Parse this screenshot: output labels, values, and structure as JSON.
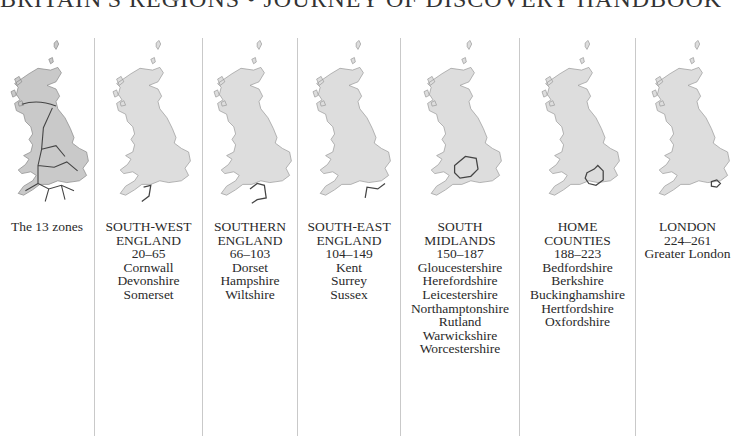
{
  "header": {
    "title": "BRITAIN'S REGIONS • JOURNEY OF DISCOVERY HANDBOOK"
  },
  "panels": [
    {
      "caption_lines": [
        "The 13 zones"
      ],
      "highlight": "all"
    },
    {
      "caption_lines": [
        "SOUTH-WEST",
        "ENGLAND",
        "20–65",
        "Cornwall",
        "Devonshire",
        "Somerset"
      ],
      "highlight": "south-west"
    },
    {
      "caption_lines": [
        "SOUTHERN",
        "ENGLAND",
        "66–103",
        "Dorset",
        "Hampshire",
        "Wiltshire"
      ],
      "highlight": "southern"
    },
    {
      "caption_lines": [
        "SOUTH-EAST",
        "ENGLAND",
        "104–149",
        "Kent",
        "Surrey",
        "Sussex"
      ],
      "highlight": "south-east"
    },
    {
      "caption_lines": [
        "SOUTH",
        "MIDLANDS",
        "150–187",
        "Gloucestershire",
        "Herefordshire",
        "Leicestershire",
        "Northamptonshire",
        "Rutland",
        "Warwickshire",
        "Worcestershire"
      ],
      "highlight": "south-midlands"
    },
    {
      "caption_lines": [
        "HOME",
        "COUNTIES",
        "188–223",
        "Bedfordshire",
        "Berkshire",
        "Buckinghamshire",
        "Hertfordshire",
        "Oxfordshire"
      ],
      "highlight": "home-counties"
    },
    {
      "caption_lines": [
        "LONDON",
        "224–261",
        "Greater London"
      ],
      "highlight": "london"
    }
  ],
  "colors": {
    "map_fill_overview": "#c9c9c9",
    "map_fill": "#dddddd",
    "outline": "#555555",
    "divider": "#c9c9c9"
  }
}
